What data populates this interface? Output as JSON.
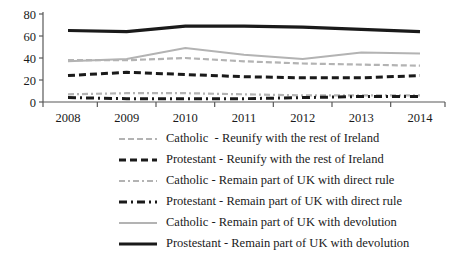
{
  "chart_data": {
    "type": "line",
    "title": "",
    "xlabel": "",
    "ylabel": "",
    "categories": [
      "2008",
      "2009",
      "2010",
      "2011",
      "2012",
      "2013",
      "2014"
    ],
    "x": [
      2008,
      2009,
      2010,
      2011,
      2012,
      2013,
      2014
    ],
    "ylim": [
      0,
      80
    ],
    "yticks": [
      0,
      20,
      40,
      60,
      80
    ],
    "ytick_labels": [
      "0",
      "20",
      "40",
      "60",
      "80"
    ],
    "grid": false,
    "legend_position": "bottom",
    "series": [
      {
        "name": "Catholic  - Reunify with the rest of Ireland",
        "key": "catholic-reunify",
        "color": "#b3b3b3",
        "style": "dashed",
        "width": 2.2,
        "dasharray": "6,3",
        "values": [
          38,
          38,
          40,
          37,
          35,
          34,
          33
        ]
      },
      {
        "name": "Protestant - Reunify with the rest of Ireland",
        "key": "protestant-reunify",
        "color": "#1a1a1a",
        "style": "dashed",
        "width": 3.0,
        "dasharray": "7,4",
        "values": [
          24,
          27,
          25,
          23,
          22,
          22,
          24
        ]
      },
      {
        "name": "Catholic - Remain part of UK with direct rule",
        "key": "catholic-direct-rule",
        "color": "#b3b3b3",
        "style": "dash-dot",
        "width": 2.2,
        "dasharray": "6,3,2,3",
        "values": [
          7,
          8,
          8,
          7,
          6,
          6,
          6
        ]
      },
      {
        "name": "Protestant - Remain part of UK with direct rule",
        "key": "protestant-direct-rule",
        "color": "#1a1a1a",
        "style": "dash-dot",
        "width": 3.0,
        "dasharray": "8,4,2,4",
        "values": [
          4,
          3,
          3,
          3,
          4,
          5,
          5
        ]
      },
      {
        "name": "Catholic - Remain part of UK with devolution",
        "key": "catholic-devolution",
        "color": "#b3b3b3",
        "style": "solid",
        "width": 2.0,
        "dasharray": "",
        "values": [
          37,
          39,
          49,
          43,
          39,
          45,
          44
        ]
      },
      {
        "name": "Prostestant - Remain part of UK with devolution",
        "key": "prostestant-devolution",
        "color": "#1a1a1a",
        "style": "solid",
        "width": 3.2,
        "dasharray": "",
        "values": [
          65,
          64,
          69,
          69,
          68,
          66,
          64
        ]
      }
    ]
  }
}
